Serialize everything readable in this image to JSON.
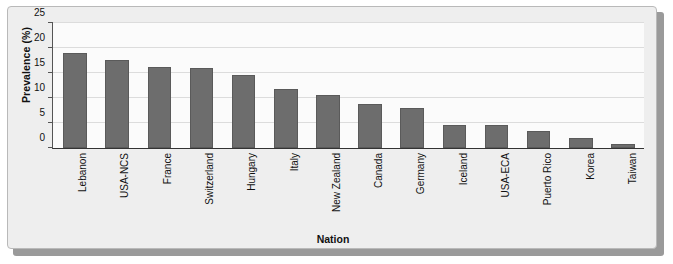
{
  "chart_data": {
    "type": "bar",
    "title": "",
    "xlabel": "Nation",
    "ylabel": "Prevalence (%)",
    "categories": [
      "Lebanon",
      "USA-NCS",
      "France",
      "Switzerland",
      "Hungary",
      "Italy",
      "New Zealand",
      "Canada",
      "Germany",
      "Iceland",
      "USA-ECA",
      "Puerto Rico",
      "Korea",
      "Taiwan"
    ],
    "values": [
      19.1,
      17.6,
      16.2,
      16.1,
      14.6,
      11.9,
      10.7,
      8.8,
      8.0,
      4.7,
      4.7,
      3.5,
      2.1,
      0.8
    ],
    "ylim": [
      0,
      25
    ],
    "yticks": [
      0,
      5,
      10,
      15,
      20,
      25
    ],
    "ytick_labels": [
      "0",
      "5",
      "10",
      "15",
      "20",
      "25"
    ],
    "grid": true,
    "legend": null,
    "bar_color": "#6d6d6d",
    "plot_background": "#fbfbfb",
    "panel_background": "#eeeeee"
  }
}
